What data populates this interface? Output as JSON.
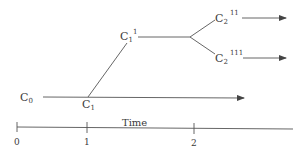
{
  "diagram": {
    "nodes": {
      "c0": {
        "base": "C",
        "sub": "0",
        "sup": ""
      },
      "c1": {
        "base": "C",
        "sub": "1",
        "sup": ""
      },
      "c1_1": {
        "base": "C",
        "sub": "1",
        "sup": "1"
      },
      "c2_11": {
        "base": "C",
        "sub": "2",
        "sup": "11"
      },
      "c2_111": {
        "base": "C",
        "sub": "2",
        "sup": "111"
      }
    },
    "axis": {
      "label": "Time",
      "ticks": [
        "0",
        "1",
        "2"
      ]
    },
    "colors": {
      "line": "#555555",
      "text": "#3a3a3a",
      "background": "#ffffff"
    }
  }
}
